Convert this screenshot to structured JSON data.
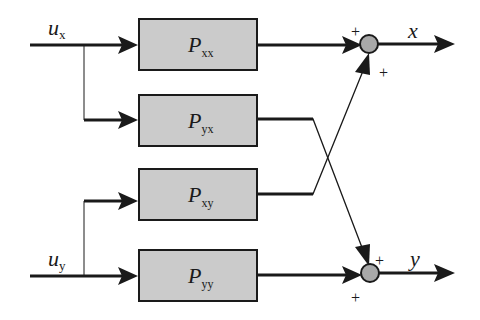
{
  "diagram": {
    "type": "block-diagram",
    "colors": {
      "block_fill": "#cbcbcb",
      "line": "#1a1a1a",
      "junction_fill": "#a9a9a9",
      "background": "#ffffff"
    },
    "inputs": [
      {
        "id": "ux",
        "symbol": "u",
        "subscript": "x"
      },
      {
        "id": "uy",
        "symbol": "u",
        "subscript": "y"
      }
    ],
    "blocks": [
      {
        "id": "Pxx",
        "symbol": "P",
        "subscript": "xx"
      },
      {
        "id": "Pyx",
        "symbol": "P",
        "subscript": "yx"
      },
      {
        "id": "Pxy",
        "symbol": "P",
        "subscript": "xy"
      },
      {
        "id": "Pyy",
        "symbol": "P",
        "subscript": "yy"
      }
    ],
    "junctions": [
      {
        "id": "sum_x",
        "signs": [
          "+",
          "+"
        ]
      },
      {
        "id": "sum_y",
        "signs": [
          "+",
          "+"
        ]
      }
    ],
    "outputs": [
      {
        "id": "x",
        "symbol": "x"
      },
      {
        "id": "y",
        "symbol": "y"
      }
    ],
    "connections": [
      {
        "from": "ux",
        "to": "Pxx"
      },
      {
        "from": "ux",
        "to": "Pyx"
      },
      {
        "from": "uy",
        "to": "Pxy"
      },
      {
        "from": "uy",
        "to": "Pyy"
      },
      {
        "from": "Pxx",
        "to": "sum_x"
      },
      {
        "from": "Pxy",
        "to": "sum_x"
      },
      {
        "from": "Pyx",
        "to": "sum_y"
      },
      {
        "from": "Pyy",
        "to": "sum_y"
      },
      {
        "from": "sum_x",
        "to": "x"
      },
      {
        "from": "sum_y",
        "to": "y"
      }
    ]
  }
}
